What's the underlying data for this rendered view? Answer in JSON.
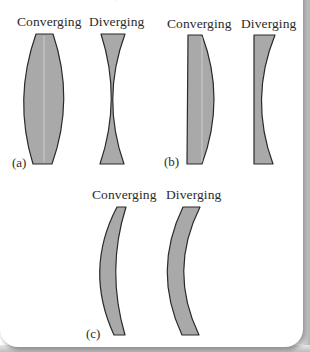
{
  "figure": {
    "top_fragment": "·",
    "panels": [
      {
        "id": "a",
        "label": "(a)",
        "converging_label": "Converging",
        "diverging_label": "Diverging",
        "converging_shape": "biconvex",
        "diverging_shape": "biconcave"
      },
      {
        "id": "b",
        "label": "(b)",
        "converging_label": "Converging",
        "diverging_label": "Diverging",
        "converging_shape": "plano-convex",
        "diverging_shape": "plano-concave"
      },
      {
        "id": "c",
        "label": "(c)",
        "converging_label": "Converging",
        "diverging_label": "Diverging",
        "converging_shape": "convex meniscus",
        "diverging_shape": "concave meniscus"
      }
    ],
    "colors": {
      "lens_fill": "#a9a9a9",
      "lens_stroke": "#2a2a2a",
      "text": "#2b2b2b",
      "page_background": "#ffffff",
      "page_shadow": "#b4b4b4"
    }
  }
}
